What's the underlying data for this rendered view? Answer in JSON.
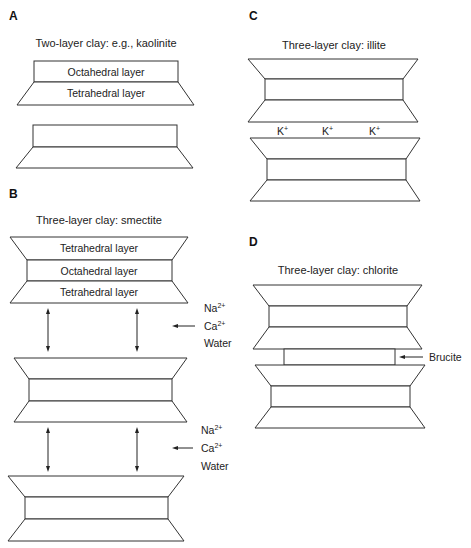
{
  "panels": {
    "A": {
      "letter": "A",
      "title": "Two-layer clay: e.g., kaolinite",
      "layers": {
        "octahedral": "Octahedral layer",
        "tetrahedral": "Tetrahedral layer"
      }
    },
    "B": {
      "letter": "B",
      "title": "Three-layer clay: smectite",
      "layers": {
        "tetrahedral_top": "Tetrahedral layer",
        "octahedral": "Octahedral layer",
        "tetrahedral_bottom": "Tetrahedral layer"
      },
      "interlayer_1": {
        "na": "Na",
        "na_charge": "2+",
        "ca": "Ca",
        "ca_charge": "2+",
        "water": "Water"
      },
      "interlayer_2": {
        "na": "Na",
        "na_charge": "2+",
        "ca": "Ca",
        "ca_charge": "2+",
        "water": "Water"
      }
    },
    "C": {
      "letter": "C",
      "title": "Three-layer clay: illite",
      "ions": [
        {
          "symbol": "K",
          "charge": "+"
        },
        {
          "symbol": "K",
          "charge": "+"
        },
        {
          "symbol": "K",
          "charge": "+"
        }
      ]
    },
    "D": {
      "letter": "D",
      "title": "Three-layer clay: chlorite",
      "brucite": "Brucite"
    }
  },
  "colors": {
    "stroke": "#333333",
    "text": "#222222",
    "background": "#ffffff"
  }
}
